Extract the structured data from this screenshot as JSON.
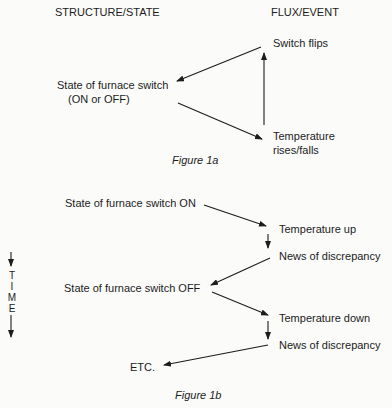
{
  "headers": {
    "left": "STRUCTURE/STATE",
    "right": "FLUX/EVENT"
  },
  "figure_1a": {
    "state_line1": "State of furnace switch",
    "state_line2": "(ON or OFF)",
    "switch_flips": "Switch flips",
    "temp_line1": "Temperature",
    "temp_line2": "rises/falls",
    "caption": "Figure 1a"
  },
  "figure_1b": {
    "state_on": "State of furnace switch ON",
    "temp_up": "Temperature up",
    "news_1": "News of discrepancy",
    "state_off": "State of furnace switch OFF",
    "temp_down": "Temperature down",
    "news_2": "News of discrepancy",
    "etc": "ETC.",
    "caption": "Figure 1b"
  },
  "time_axis": {
    "letters": [
      "T",
      "I",
      "M",
      "E"
    ]
  }
}
